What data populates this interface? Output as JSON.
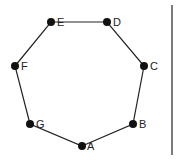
{
  "diagram": {
    "type": "heptagon",
    "vertices": [
      {
        "id": "A",
        "label": "A",
        "x": 82,
        "y": 146,
        "lx": 87,
        "ly": 150
      },
      {
        "id": "B",
        "label": "B",
        "x": 133,
        "y": 124,
        "lx": 139,
        "ly": 128
      },
      {
        "id": "C",
        "label": "C",
        "x": 144,
        "y": 66,
        "lx": 150,
        "ly": 70
      },
      {
        "id": "D",
        "label": "D",
        "x": 107,
        "y": 22,
        "lx": 113,
        "ly": 26
      },
      {
        "id": "E",
        "label": "E",
        "x": 51,
        "y": 22,
        "lx": 57,
        "ly": 26
      },
      {
        "id": "F",
        "label": "F",
        "x": 15,
        "y": 66,
        "lx": 21,
        "ly": 70
      },
      {
        "id": "G",
        "label": "G",
        "x": 30,
        "y": 124,
        "lx": 36,
        "ly": 128
      }
    ],
    "edges": [
      [
        "A",
        "B"
      ],
      [
        "B",
        "C"
      ],
      [
        "C",
        "D"
      ],
      [
        "D",
        "E"
      ],
      [
        "E",
        "F"
      ],
      [
        "F",
        "G"
      ],
      [
        "G",
        "A"
      ]
    ],
    "divider": {
      "x": 172,
      "y1": 5,
      "y2": 155
    },
    "colors": {
      "stroke": "#222222",
      "point": "#111111",
      "background": "#ffffff"
    }
  }
}
